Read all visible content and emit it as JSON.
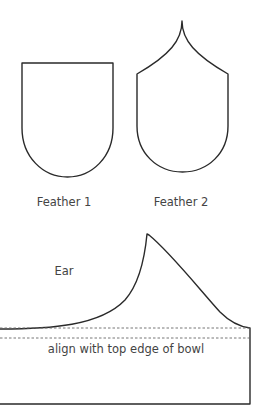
{
  "templates": {
    "feather_1": {
      "label": "Feather 1"
    },
    "feather_2": {
      "label": "Feather 2"
    },
    "ear": {
      "label": "Ear",
      "guide_text": "align with top edge of bowl"
    }
  },
  "colors": {
    "outline": "#2a2a2a",
    "text": "#444444",
    "guide": "#666666",
    "background": "#ffffff"
  }
}
